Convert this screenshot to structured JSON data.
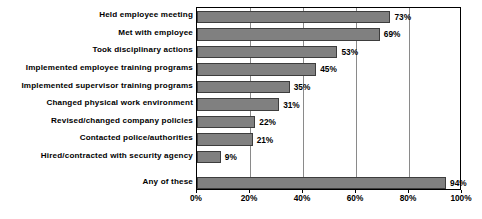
{
  "chart_data": {
    "type": "bar",
    "orientation": "horizontal",
    "title": "",
    "xlabel": "",
    "ylabel": "",
    "xlim": [
      0,
      100
    ],
    "grid": true,
    "legend": null,
    "categories": [
      "Held employee meeting",
      "Met with employee",
      "Took disciplinary actions",
      "Implemented employee training programs",
      "Implemented supervisor training programs",
      "Changed physical work environment",
      "Revised/changed company policies",
      "Contacted police/authorities",
      "Hired/contracted with security agency",
      "Any of these"
    ],
    "values": [
      73,
      69,
      53,
      45,
      35,
      31,
      22,
      21,
      9,
      94
    ],
    "value_labels": [
      "73%",
      "69%",
      "53%",
      "45%",
      "35%",
      "31%",
      "22%",
      "21%",
      "9%",
      "94%"
    ],
    "xticks": [
      0,
      20,
      40,
      60,
      80,
      100
    ],
    "xtick_labels": [
      "0%",
      "20%",
      "40%",
      "60%",
      "80%",
      "100%"
    ],
    "colors": {
      "bar_fill": "#808080",
      "bar_border": "#3d3d3d",
      "axis": "#000000",
      "gridline": "#8a8a8a",
      "background": "#ffffff",
      "text": "#000000"
    }
  }
}
